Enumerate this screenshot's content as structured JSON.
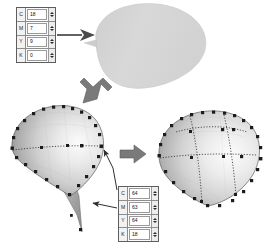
{
  "figure": {
    "background_color": "#ffffff"
  },
  "palette": {
    "shape_fill_light": "#e2e2e2",
    "shape_fill_mid": "#c9c9c9",
    "shape_fill_dark": "#9a9a9a",
    "outline": "#4a4a4a",
    "control_point": "#1c1c1c",
    "arrow_fill": "#6f6f6f",
    "thin_line": "#3a3a3a"
  },
  "top_table": {
    "name": "color-value-spinner-panel-top",
    "rows": [
      {
        "label": "C",
        "value": "18"
      },
      {
        "label": "M",
        "value": "7"
      },
      {
        "label": "Y",
        "value": "9"
      },
      {
        "label": "K",
        "value": "0"
      }
    ]
  },
  "bottom_table": {
    "name": "coordinate-value-spinner-panel-bottom",
    "rows": [
      {
        "label": "C",
        "value": "64"
      },
      {
        "label": "M",
        "value": "63"
      },
      {
        "label": "Y",
        "value": "64"
      },
      {
        "label": "K",
        "value": "18"
      }
    ]
  },
  "shapes": {
    "blob_plain": {
      "name": "plain-filled-blob-shape",
      "caption": "smooth unshaded teardrop surface"
    },
    "mesh_left": {
      "name": "shaded-mesh-surface-left",
      "caption": "shaded surface with boundary control points and one centre isoline",
      "control_point_count": 28,
      "isoline_count": 1
    },
    "mesh_right": {
      "name": "shaded-mesh-surface-right",
      "caption": "shaded surface with boundary control points and multiple isolines",
      "control_point_count": 30,
      "isoline_count": 4
    }
  },
  "arrows": {
    "table_to_blob": {
      "name": "arrow-table-to-blob",
      "direction": "right"
    },
    "blob_to_mesh": {
      "name": "arrow-blob-to-mesh",
      "direction": "down-left"
    },
    "mesh_to_mesh": {
      "name": "arrow-mesh-to-mesh",
      "direction": "right"
    },
    "table_to_tail": {
      "name": "arrow-table-to-tail-point",
      "direction": "left"
    },
    "table_to_edge": {
      "name": "arrow-table-to-edge-point",
      "direction": "up-left"
    }
  }
}
